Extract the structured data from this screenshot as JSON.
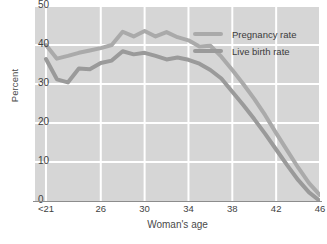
{
  "chart_data": {
    "type": "line",
    "title": "",
    "xlabel": "Woman's age",
    "ylabel": "Percent",
    "xlim": [
      20,
      46
    ],
    "ylim": [
      0,
      50
    ],
    "grid": true,
    "legend_position": "top-right-inside",
    "x_tick_labels": [
      "<21",
      "26",
      "30",
      "34",
      "38",
      "42",
      "46"
    ],
    "x_tick_values": [
      21,
      26,
      30,
      34,
      38,
      42,
      46
    ],
    "y_tick_labels": [
      "0",
      "10",
      "20",
      "30",
      "40",
      "50"
    ],
    "y_tick_values": [
      0,
      10,
      20,
      30,
      40,
      50
    ],
    "x": [
      21,
      22,
      23,
      24,
      25,
      26,
      27,
      28,
      29,
      30,
      31,
      32,
      33,
      34,
      35,
      36,
      37,
      38,
      39,
      40,
      41,
      42,
      43,
      44,
      45,
      46
    ],
    "series": [
      {
        "name": "Pregnancy rate",
        "color": "#aaaaaa",
        "values": [
          40.0,
          36.5,
          37.2,
          38.0,
          38.6,
          39.2,
          40.0,
          43.4,
          42.2,
          43.6,
          42.2,
          43.3,
          42.0,
          41.2,
          39.6,
          39.8,
          37.0,
          33.6,
          30.0,
          26.2,
          22.0,
          17.4,
          13.0,
          8.6,
          4.6,
          1.5
        ]
      },
      {
        "name": "Live birth rate",
        "color": "#9a9a9a",
        "values": [
          36.4,
          31.2,
          30.4,
          34.0,
          33.8,
          35.4,
          36.0,
          38.4,
          37.6,
          38.0,
          37.2,
          36.3,
          36.8,
          36.2,
          35.2,
          33.6,
          31.4,
          28.0,
          24.6,
          21.0,
          17.2,
          13.2,
          9.2,
          5.4,
          2.2,
          0.0
        ]
      }
    ]
  },
  "axes": {
    "ylabel": "Percent",
    "xlabel": "Woman's age"
  },
  "legend": {
    "items": [
      {
        "label": "Pregnancy rate"
      },
      {
        "label": "Live birth rate"
      }
    ]
  },
  "style": {
    "panel_background": "#d6d6d6",
    "gridline_color": "#ffffff",
    "axis_line_color": "#8d8d8d",
    "tick_text_color": "#3f3f3f",
    "pregnancy_color": "#aaaaaa",
    "livebirth_color": "#9a9a9a"
  }
}
